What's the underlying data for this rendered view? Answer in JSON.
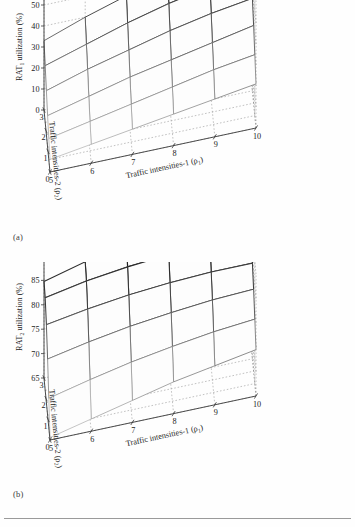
{
  "figure": {
    "panels": [
      {
        "key": "a",
        "sublabel": "(a)",
        "zlabel_main": "RAT",
        "zlabel_sub": "1",
        "zlabel_tail": " utilization (%)",
        "xlabel_main": "Traffic intensities-1 (ρ",
        "xlabel_sub": "1",
        "xlabel_tail": ")",
        "ylabel_main": "Traffic intensities-2 (ρ",
        "ylabel_sub": "2",
        "ylabel_tail": ")",
        "zticks": [
          "0",
          "10",
          "20",
          "30",
          "40",
          "50",
          "60"
        ],
        "xticks": [
          "5",
          "6",
          "7",
          "8",
          "9",
          "10"
        ],
        "yticks": [
          "0",
          "1",
          "2",
          "3"
        ]
      },
      {
        "key": "b",
        "sublabel": "(b)",
        "zlabel_main": "RAT",
        "zlabel_sub": "2",
        "zlabel_tail": " utilization (%)",
        "xlabel_main": "Traffic intensities-1 (ρ",
        "xlabel_sub": "1",
        "xlabel_tail": ")",
        "ylabel_main": "Traffic intensities-2 (ρ",
        "ylabel_sub": "2",
        "ylabel_tail": ")",
        "zticks": [
          "65",
          "70",
          "75",
          "80",
          "85",
          "90"
        ],
        "xticks": [
          "5",
          "6",
          "7",
          "8",
          "9",
          "10"
        ],
        "yticks": [
          "0",
          "1",
          "2",
          "3"
        ]
      }
    ]
  },
  "chart_data": [
    {
      "type": "surface",
      "panel": "a",
      "title": "",
      "xlabel": "Traffic intensities-1 (ρ1)",
      "ylabel": "Traffic intensities-2 (ρ2)",
      "zlabel": "RAT1 utilization (%)",
      "xlim": [
        5,
        10
      ],
      "ylim": [
        0,
        3
      ],
      "zlim": [
        0,
        60
      ],
      "ztick_step": 10,
      "xtick_step": 1,
      "ytick_step": 1,
      "grid": true,
      "legend": "none",
      "x": [
        5,
        6,
        7,
        8,
        9,
        10
      ],
      "y": [
        0,
        0.6,
        1.2,
        1.8,
        2.4,
        3
      ],
      "z": [
        [
          6,
          9,
          12,
          15,
          18,
          21
        ],
        [
          10,
          14,
          18,
          22,
          26,
          29
        ],
        [
          15,
          20,
          25,
          29,
          33,
          37
        ],
        [
          21,
          27,
          32,
          37,
          41,
          44
        ],
        [
          27,
          33,
          39,
          44,
          48,
          52
        ],
        [
          33,
          40,
          46,
          51,
          56,
          60
        ]
      ]
    },
    {
      "type": "surface",
      "panel": "b",
      "title": "",
      "xlabel": "Traffic intensities-1 (ρ1)",
      "ylabel": "Traffic intensities-2 (ρ2)",
      "zlabel": "RAT2 utilization (%)",
      "xlim": [
        5,
        10
      ],
      "ylim": [
        0,
        3
      ],
      "zlim": [
        65,
        90
      ],
      "ztick_step": 5,
      "xtick_step": 1,
      "ytick_step": 1,
      "grid": true,
      "legend": "none",
      "x": [
        5,
        6,
        7,
        8,
        9,
        10
      ],
      "y": [
        0,
        0.6,
        1.2,
        1.8,
        2.4,
        3
      ],
      "z": [
        [
          65.5,
          67.5,
          69.5,
          71.5,
          73.0,
          74.5
        ],
        [
          71.0,
          73.0,
          74.8,
          76.2,
          77.4,
          78.2
        ],
        [
          76.5,
          78.2,
          79.6,
          80.6,
          81.4,
          81.8
        ],
        [
          81.0,
          82.4,
          83.5,
          84.2,
          84.6,
          84.6
        ],
        [
          84.0,
          85.6,
          86.7,
          87.4,
          87.6,
          87.2
        ],
        [
          84.8,
          87.0,
          88.6,
          89.8,
          90.0,
          88.0
        ]
      ]
    }
  ]
}
